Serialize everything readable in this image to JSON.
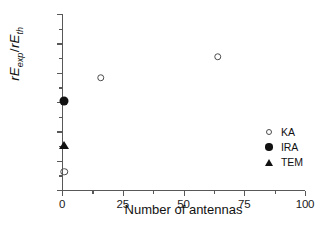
{
  "chart_data": {
    "type": "scatter",
    "title": "",
    "xlabel": "Number of antennas",
    "ylabel": "rE_exp/rE_th",
    "ylabel_parts": {
      "lead": "rE",
      "sub1": "exp",
      "slash": "/",
      "lead2": "rE",
      "sub2": "th"
    },
    "xlim": [
      0,
      100
    ],
    "ylim": [
      0.2,
      0.8
    ],
    "xticks": [
      0,
      25,
      50,
      75,
      100
    ],
    "xtick_labels": [
      "0",
      "25",
      "50",
      "75",
      "100"
    ],
    "x_minor_step": 12.5,
    "yticks": [
      0.2,
      0.3,
      0.4,
      0.5,
      0.6,
      0.7,
      0.8
    ],
    "ytick_labels": [
      "0.2",
      "0.3",
      "0.4",
      "0.5",
      "0.6",
      "0.7",
      "0.8"
    ],
    "y_minor_step": 0.05,
    "grid": false,
    "legend_position": "lower right",
    "series": [
      {
        "name": "KA",
        "marker": "open-circle",
        "color": "#4d4d4d",
        "points": [
          {
            "x": 1,
            "y": 0.262
          },
          {
            "x": 16,
            "y": 0.583
          },
          {
            "x": 64,
            "y": 0.655
          }
        ]
      },
      {
        "name": "IRA",
        "marker": "filled-circle",
        "color": "#111111",
        "points": [
          {
            "x": 1,
            "y": 0.502
          }
        ]
      },
      {
        "name": "TEM",
        "marker": "filled-triangle",
        "color": "#111111",
        "points": [
          {
            "x": 1,
            "y": 0.353
          }
        ]
      }
    ]
  },
  "legend": {
    "entries": [
      {
        "label": "KA",
        "marker": "open-circle"
      },
      {
        "label": "IRA",
        "marker": "filled-circle"
      },
      {
        "label": "TEM",
        "marker": "filled-triangle"
      }
    ]
  },
  "axes": {
    "x_title": "Number of antennas",
    "y_title": "rE_exp/rE_th"
  },
  "colors": {
    "axis": "#585858",
    "text": "#111111",
    "marker_open": "#4d4d4d",
    "marker_filled": "#111111",
    "background": "#ffffff"
  }
}
